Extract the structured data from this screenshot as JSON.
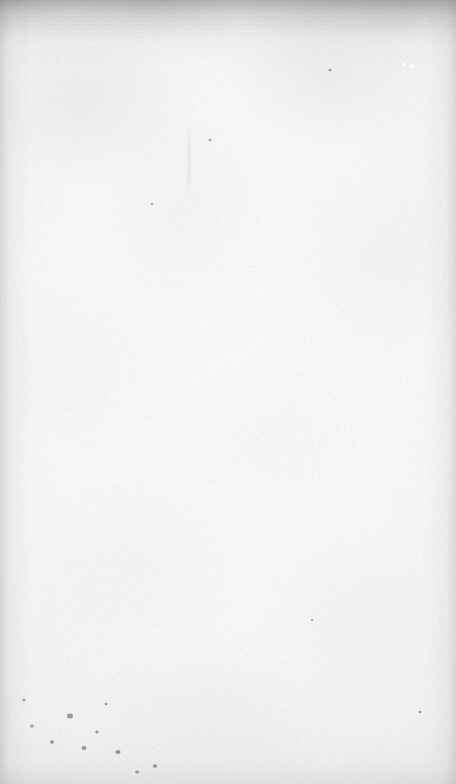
{
  "document": {
    "kind": "scanned-page",
    "content_type": "blank",
    "visible_text": "",
    "page_width": 456,
    "page_height": 784,
    "description": "Blank aged paper page from a book scan, no printed or handwritten text visible"
  },
  "appearance": {
    "paper_color": "#fbfbfb",
    "center_color": "#ffffff",
    "edge_color": "#e2e2e2",
    "grain_color": "#9a9a9a",
    "speck_color": "#8a8a8a",
    "scuff_color": "#787878"
  },
  "artifacts": {
    "top_scuff": {
      "name": "horizontal-scuff-streaks",
      "region": "top edge",
      "height_px": 44
    },
    "edge_vignette": {
      "name": "scan-edge-darkening",
      "top_px": 14,
      "left_px": 9,
      "right_px": 9,
      "bottom_px": 20
    },
    "foxing": {
      "name": "foxing-speckles",
      "region": "bottom-left corner"
    },
    "crease": {
      "name": "vertical-crease-streak",
      "x": 186,
      "y": 118,
      "height": 82
    },
    "highlight_specks": [
      {
        "x": 404,
        "y": 65,
        "r": 2.1
      },
      {
        "x": 412,
        "y": 66,
        "r": 1.9
      }
    ]
  }
}
